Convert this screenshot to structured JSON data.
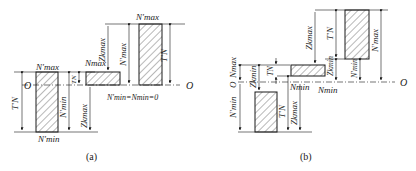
{
  "figure": {
    "colors": {
      "stroke": "#1a1a1a",
      "hatch": "#333333",
      "background": "#ffffff"
    },
    "panel_a": {
      "caption": "(a)",
      "origin_labels": [
        "O",
        "O"
      ],
      "labels": {
        "left_top": "N′max",
        "left_bottom": "N′min",
        "left_tn": "T′N",
        "left_nmin": "N′min",
        "mid_nmax": "Nmax",
        "mid_tn": "TN",
        "mid_zkmax": "Zkmax",
        "mid_eq": "N′min=Nmin=0",
        "right_top": "N′max",
        "right_zkmax": "Zkmax",
        "right_nmax": "N′max",
        "right_tn": "T′N"
      }
    },
    "panel_b": {
      "caption": "(b)",
      "origin_labels": [
        "O",
        "O"
      ],
      "labels": {
        "left_nmax": "Nmax",
        "left_zkmin": "Zkmin",
        "left_nmin": "N′min",
        "mid_tn": "TN",
        "mid_nmin": "Nmin",
        "lower_tn": "T′N",
        "lower_zkmax": "Zkmax",
        "right_zkmax": "Zkmax",
        "right_tn": "T′N",
        "right_zkmin": "Zkmin",
        "right_nmin_label": "Nmin",
        "right_nprime_min": "N′min",
        "right_nprime_max": "N′max"
      }
    }
  }
}
